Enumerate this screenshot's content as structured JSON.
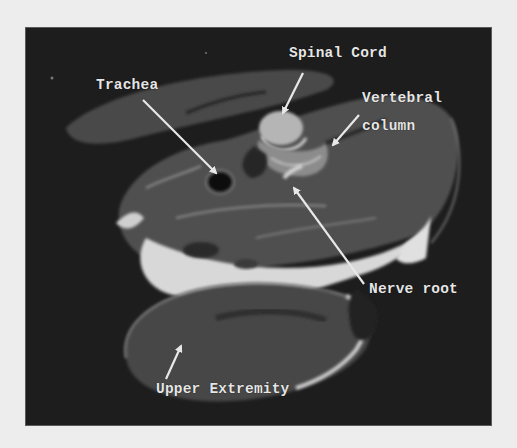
{
  "figure": {
    "type": "annotated axial MRI cross-section",
    "background_color": "#ededed",
    "frame_color": "#1c1c1c",
    "label_color": "#e6e6e6",
    "labels": {
      "spinal_cord": "Spinal Cord",
      "trachea": "Trachea",
      "vertebral_column_line1": "Vertebral",
      "vertebral_column_line2": "column",
      "nerve_root": "Nerve root",
      "upper_extremity": "Upper Extremity"
    }
  }
}
